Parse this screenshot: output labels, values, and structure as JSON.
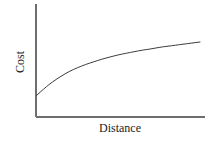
{
  "chart_data": {
    "type": "line",
    "title": "",
    "subtitle": "",
    "xlabel": "Distance",
    "ylabel": "Cost",
    "grid": false,
    "legend": null,
    "axes": {
      "x_ticks": [],
      "y_ticks": [],
      "xlim": [
        0,
        1
      ],
      "ylim": [
        0,
        1
      ],
      "spines": [
        "left",
        "bottom"
      ],
      "arrowheads": false
    },
    "series": [
      {
        "name": "Cost vs Distance",
        "style": "solid",
        "color": "#3c3c3c",
        "width": 1,
        "description": "Monotonically increasing concave curve that rises steeply near the origin and flattens toward an asymptote at the right",
        "x": [
          0.0,
          0.05,
          0.1,
          0.15,
          0.2,
          0.25,
          0.3,
          0.35,
          0.4,
          0.45,
          0.5,
          0.55,
          0.6,
          0.65,
          0.7,
          0.75,
          0.8,
          0.85,
          0.9,
          0.95,
          1.0
        ],
        "y": [
          0.0,
          0.14,
          0.26,
          0.36,
          0.45,
          0.52,
          0.58,
          0.63,
          0.68,
          0.72,
          0.76,
          0.79,
          0.82,
          0.85,
          0.87,
          0.9,
          0.92,
          0.94,
          0.96,
          0.98,
          1.0
        ]
      }
    ]
  },
  "labels": {
    "y_axis": "Cost",
    "x_axis": "Distance"
  },
  "colors": {
    "axis": "#6e6e6e",
    "curve": "#3c3c3c",
    "text": "#1c1c1c",
    "background": "#ffffff"
  }
}
